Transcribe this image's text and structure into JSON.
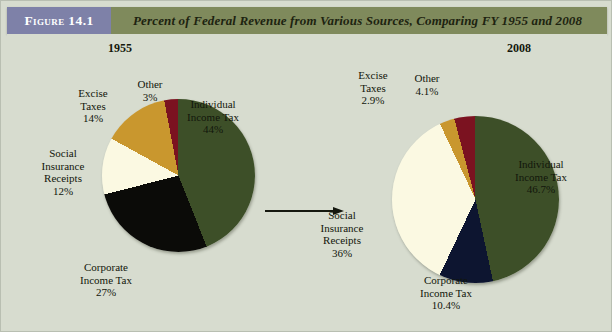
{
  "figure": {
    "tag": "Figure 14.1",
    "title": "Percent of Federal Revenue from Various Sources, Comparing FY 1955 and 2008",
    "tag_bg": "#7e81a8",
    "header_bg": "#7f8a5c",
    "page_bg": "#d7dccf",
    "arrow_icon": "right-arrow-icon"
  },
  "chart_data": [
    {
      "type": "pie",
      "title": "1955",
      "categories": [
        "Individual Income Tax",
        "Corporate Income Tax",
        "Social Insurance Receipts",
        "Excise Taxes",
        "Other"
      ],
      "values": [
        44,
        27,
        12,
        14,
        3
      ],
      "labels": [
        "Individual\nIncome Tax\n44%",
        "Corporate\nIncome Tax\n27%",
        "Social\nInsurance\nReceipts\n12%",
        "Excise\nTaxes\n14%",
        "Other\n3%"
      ],
      "value_labels": [
        "44%",
        "27%",
        "12%",
        "14%",
        "3%"
      ],
      "colors": [
        "#3d4f28",
        "#0b0b08",
        "#fbf9e2",
        "#c9972e",
        "#7b1220"
      ],
      "start_angle": 0,
      "direction": "clockwise",
      "legend": "none",
      "xlabel": "",
      "ylabel": ""
    },
    {
      "type": "pie",
      "title": "2008",
      "categories": [
        "Individual Income Tax",
        "Corporate Income Tax",
        "Social Insurance Receipts",
        "Excise Taxes",
        "Other"
      ],
      "values": [
        46.7,
        10.4,
        36,
        2.9,
        4.1
      ],
      "labels": [
        "Individual\nIncome Tax\n46.7%",
        "Corporate\nIncome Tax\n10.4%",
        "Social\nInsurance\nReceipts\n36%",
        "Excise\nTaxes\n2.9%",
        "Other\n4.1%"
      ],
      "value_labels": [
        "46.7%",
        "10.4%",
        "36%",
        "2.9%",
        "4.1%"
      ],
      "colors": [
        "#3d4f28",
        "#0d1530",
        "#fbf9e2",
        "#c9972e",
        "#7b1220"
      ],
      "start_angle": 0,
      "direction": "clockwise",
      "legend": "none",
      "xlabel": "",
      "ylabel": ""
    }
  ]
}
